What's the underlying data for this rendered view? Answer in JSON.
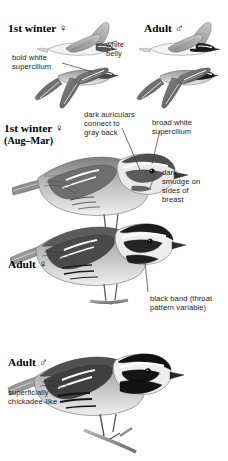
{
  "plate": {
    "width": 228,
    "height": 461,
    "background": "#ffffff",
    "ink": "#1b1b1b",
    "species_tone_dark": "#2b2b2b",
    "species_tone_mid": "#8d8d8d",
    "species_tone_light": "#d8d8d8"
  },
  "headings": {
    "first_winter_female_flight": "1st winter ♀",
    "adult_male_flight": "Adult ♂",
    "first_winter_female_perched": "1st winter ♀",
    "first_winter_female_perched_months": "(Aug–Mar)",
    "adult_female_perched": "Adult ♀",
    "adult_male_perched": "Adult ♂"
  },
  "annotations": {
    "bold_white_supercilium": "bold white\nsupercilium",
    "white_belly": "white\nbelly",
    "dark_auriculars": "dark auriculars\nconnect to\ngray back",
    "broad_white_supercilium": "broad white\nsupercilium",
    "dark_smudge": "dark\nsmudge on\nsides of\nbreast",
    "black_band": "black band (throat\npattern variable)",
    "chickadee_like": "superficially\nchickadee-like"
  },
  "top_bleed_text": "",
  "figures": [
    {
      "name": "first-winter-female-flight-upper",
      "pose": "flight-upperwing",
      "age": "1st winter",
      "sex": "female"
    },
    {
      "name": "adult-male-flight-upper",
      "pose": "flight-upperwing",
      "age": "Adult",
      "sex": "male"
    },
    {
      "name": "first-winter-female-flight-lower",
      "pose": "flight-underwing",
      "age": "1st winter",
      "sex": "female"
    },
    {
      "name": "adult-male-flight-lower",
      "pose": "flight-underwing",
      "age": "Adult",
      "sex": "male"
    },
    {
      "name": "first-winter-female-perched",
      "pose": "perched",
      "age": "1st winter",
      "sex": "female"
    },
    {
      "name": "adult-female-perched",
      "pose": "perched",
      "age": "Adult",
      "sex": "female"
    },
    {
      "name": "adult-male-perched",
      "pose": "perched",
      "age": "Adult",
      "sex": "male"
    }
  ]
}
